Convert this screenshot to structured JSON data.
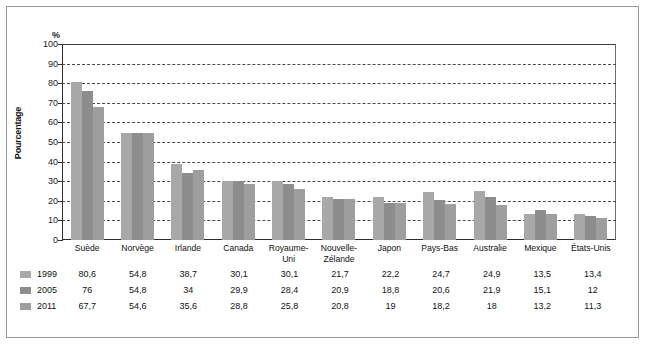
{
  "chart_data": {
    "type": "bar",
    "title": "",
    "xlabel": "",
    "ylabel": "Pourcentage",
    "unit_symbol": "%",
    "ylim": [
      0,
      100
    ],
    "yticks": [
      0,
      10,
      20,
      30,
      40,
      50,
      60,
      70,
      80,
      90,
      100
    ],
    "grid": true,
    "legend_position": "bottom-left",
    "categories": [
      "Suède",
      "Norvège",
      "Irlande",
      "Canada",
      "Royaume-\nUni",
      "Nouvelle-\nZélande",
      "Japon",
      "Pays-Bas",
      "Australie",
      "Mexique",
      "États-Unis"
    ],
    "series": [
      {
        "name": "1999",
        "color": "#a8a8a8",
        "values": [
          80.6,
          54.8,
          38.7,
          30.1,
          30.1,
          21.7,
          22.2,
          24.7,
          24.9,
          13.5,
          13.4
        ],
        "labels": [
          "80,6",
          "54,8",
          "38,7",
          "30,1",
          "30,1",
          "21,7",
          "22,2",
          "24,7",
          "24,9",
          "13,5",
          "13,4"
        ]
      },
      {
        "name": "2005",
        "color": "#8d8d8d",
        "values": [
          76,
          54.8,
          34,
          29.9,
          28.4,
          20.9,
          18.8,
          20.6,
          21.9,
          15.1,
          12
        ],
        "labels": [
          "76",
          "54,8",
          "34",
          "29,9",
          "28,4",
          "20,9",
          "18,8",
          "20,6",
          "21,9",
          "15,1",
          "12"
        ]
      },
      {
        "name": "2011",
        "color": "#9e9e9e",
        "values": [
          67.7,
          54.6,
          35.6,
          28.8,
          25.8,
          20.8,
          19,
          18.2,
          18,
          13.2,
          11.3
        ],
        "labels": [
          "67,7",
          "54,6",
          "35,6",
          "28,8",
          "25,8",
          "20,8",
          "19",
          "18,2",
          "18",
          "13,2",
          "11,3"
        ]
      }
    ]
  }
}
